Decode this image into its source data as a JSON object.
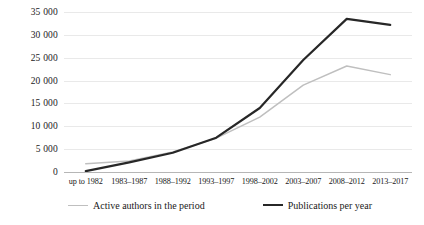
{
  "chart_data": {
    "type": "line",
    "title": "",
    "subtitle": "",
    "xlabel": "",
    "ylabel": "",
    "ylim": [
      0,
      35000
    ],
    "yticks": [
      0,
      5000,
      10000,
      15000,
      20000,
      25000,
      30000,
      35000
    ],
    "ytick_labels": [
      "0",
      "5 000",
      "10 000",
      "15 000",
      "20 000",
      "25 000",
      "30 000",
      "35 000"
    ],
    "grid": true,
    "grid_axis": "y",
    "legend_position": "bottom",
    "categories": [
      "up to 1982",
      "1983–1987",
      "1988–1992",
      "1993–1997",
      "1998–2002",
      "2003–2007",
      "2008–2012",
      "2013–2017"
    ],
    "series": [
      {
        "name": "Active authors in the period",
        "color": "#bfbfbf",
        "values": [
          1800,
          2400,
          4400,
          7400,
          12000,
          19000,
          23200,
          21300
        ]
      },
      {
        "name": "Publications per year",
        "color": "#272727",
        "values": [
          200,
          2100,
          4200,
          7500,
          14000,
          24500,
          33500,
          32200
        ]
      }
    ]
  },
  "legend": {
    "items": [
      {
        "label": "Active authors in the period",
        "swatch": "authors"
      },
      {
        "label": "Publications per year",
        "swatch": "publications"
      }
    ]
  }
}
